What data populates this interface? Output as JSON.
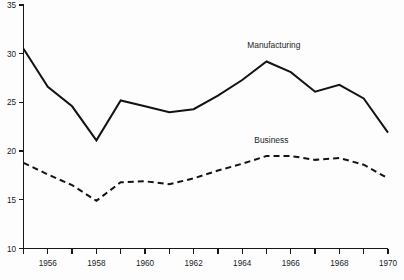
{
  "chart_data": {
    "type": "line",
    "title": "",
    "subtitle": "",
    "xlabel": "",
    "ylabel": "",
    "xlim": [
      1955,
      1970
    ],
    "ylim": [
      10,
      35
    ],
    "grid": false,
    "legend_position": "inline-annotation",
    "x": [
      1955,
      1956,
      1957,
      1958,
      1959,
      1960,
      1961,
      1962,
      1963,
      1964,
      1965,
      1966,
      1967,
      1968,
      1969,
      1970
    ],
    "y_ticks": [
      10,
      15,
      20,
      25,
      30,
      35
    ],
    "y_tick_labels": [
      "10",
      "15",
      "20",
      "25",
      "30",
      "35"
    ],
    "x_ticks": [
      1955,
      1956,
      1957,
      1958,
      1959,
      1960,
      1961,
      1962,
      1963,
      1964,
      1965,
      1966,
      1967,
      1968,
      1969,
      1970
    ],
    "x_tick_labels": [
      "",
      "1956",
      "",
      "1958",
      "",
      "1960",
      "",
      "1962",
      "",
      "1964",
      "",
      "1966",
      "",
      "1968",
      "",
      "1970"
    ],
    "series": [
      {
        "name": "Manufacturing",
        "style": "solid",
        "color": "#111315",
        "label_text": "Manufacturing",
        "values": [
          30.5,
          26.6,
          24.6,
          21.1,
          25.2,
          24.6,
          24.0,
          24.3,
          25.7,
          27.3,
          29.2,
          28.1,
          26.1,
          26.8,
          25.4,
          21.9
        ]
      },
      {
        "name": "Business",
        "style": "dashed",
        "color": "#111315",
        "label_text": "Business",
        "values": [
          18.8,
          17.6,
          16.5,
          14.9,
          16.8,
          16.9,
          16.6,
          17.2,
          18.0,
          18.7,
          19.5,
          19.5,
          19.1,
          19.3,
          18.6,
          17.2
        ]
      }
    ],
    "annotations": [
      {
        "text": "Manufacturing",
        "x": 1965.3,
        "y": 30.6
      },
      {
        "text": "Business",
        "x": 1965.2,
        "y": 20.8
      }
    ]
  }
}
